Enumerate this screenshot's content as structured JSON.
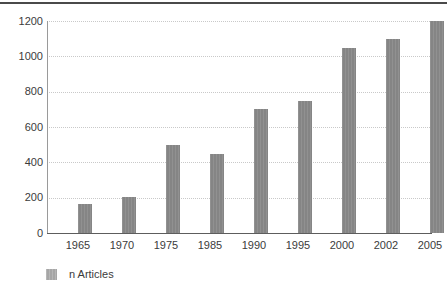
{
  "chart_data": {
    "type": "bar",
    "title": "",
    "subtitle": "",
    "xlabel": "",
    "ylabel": "",
    "categories": [
      "1965",
      "1970",
      "1975",
      "1985",
      "1990",
      "1995",
      "2000",
      "2002",
      "2005"
    ],
    "values": [
      165,
      205,
      500,
      450,
      700,
      750,
      1050,
      1100,
      1200
    ],
    "series": [
      {
        "name": "n Articles",
        "values": [
          165,
          205,
          500,
          450,
          700,
          750,
          1050,
          1100,
          1200
        ],
        "color": "#858585"
      }
    ],
    "ylim": [
      0,
      1200
    ],
    "yticks": [
      0,
      200,
      400,
      600,
      800,
      1000,
      1200
    ],
    "ytick_labels": [
      "0",
      "200",
      "400",
      "600",
      "800",
      "1000",
      "1200"
    ],
    "grid": "horizontal-dotted",
    "legend": {
      "position": "bottom-left",
      "entries": [
        {
          "label": "n Articles",
          "color": "#a6a6a6"
        }
      ]
    },
    "colors": {
      "bar_fill": "#858585",
      "legend_swatch": "#a6a6a6",
      "gridline": "#c9c9c9",
      "axis": "#5d5d5d",
      "text": "#3b3b3b",
      "background": "#ffffff",
      "top_rule": "#4a4a4a"
    }
  }
}
